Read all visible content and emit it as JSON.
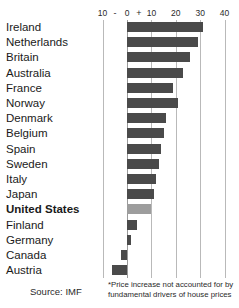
{
  "chart_data": {
    "type": "bar",
    "orientation": "horizontal",
    "title": "",
    "subtitle": "",
    "xlabel": "",
    "ylabel": "",
    "xlim": [
      -10,
      40
    ],
    "xticks": [
      -10,
      0,
      10,
      20,
      30,
      40
    ],
    "xtick_labels": [
      "10",
      "0",
      "10",
      "20",
      "30",
      "40"
    ],
    "axis_signs": {
      "minus": "-",
      "plus": "+"
    },
    "grid": true,
    "grid_axis": "x",
    "legend": "none",
    "units": "percent",
    "categories": [
      "Ireland",
      "Netherlands",
      "Britain",
      "Australia",
      "France",
      "Norway",
      "Denmark",
      "Belgium",
      "Spain",
      "Sweden",
      "Italy",
      "Japan",
      "United States",
      "Finland",
      "Germany",
      "Canada",
      "Austria"
    ],
    "values": [
      31,
      29,
      26,
      23,
      19,
      21,
      16,
      15,
      14,
      13,
      12,
      11,
      10,
      4,
      1.5,
      -2.5,
      -6
    ],
    "highlight_category": "United States",
    "colors": {
      "bar": "#4a4a4a",
      "bar_highlight": "#9d9d9d",
      "gridline": "#b9b9b9",
      "zero_line": "#9a9a9a",
      "text": "#1a1a1a",
      "background": "#ffffff"
    }
  },
  "footer": {
    "source": "Source: IMF",
    "footnote_line1": "*Price increase not accounted for by",
    "footnote_line2": "fundamental drivers of house prices"
  }
}
